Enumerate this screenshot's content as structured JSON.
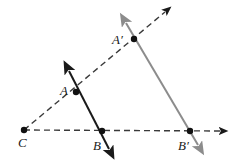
{
  "figure": {
    "background_color": "#ffffff",
    "width": 239,
    "height": 163
  },
  "colors": {
    "ink": "#1a1a1a",
    "dashed": "#3a3a3a",
    "image_gray": "#8c8c8c",
    "point_fill": "#111111"
  },
  "points": [
    {
      "id": "C",
      "label": "C",
      "x": 24,
      "y": 130,
      "label_x": 18,
      "label_y": 147,
      "dot": true
    },
    {
      "id": "A",
      "label": "A",
      "x": 76,
      "y": 92,
      "label_x": 60,
      "label_y": 95,
      "dot": true
    },
    {
      "id": "B",
      "label": "B",
      "x": 102,
      "y": 131,
      "label_x": 93,
      "label_y": 150,
      "dot": true
    },
    {
      "id": "Ap",
      "label": "A′",
      "x": 134,
      "y": 39,
      "label_x": 112,
      "label_y": 44,
      "dot": true
    },
    {
      "id": "Bp",
      "label": "B′",
      "x": 190,
      "y": 131,
      "label_x": 178,
      "label_y": 150,
      "dot": true
    }
  ],
  "lines": [
    {
      "id": "ray-C-A-Ap",
      "name": "dashed-ray-through-A-and-A-prime",
      "style": "dashed",
      "color": "#3a3a3a",
      "from": {
        "x": 24,
        "y": 130
      },
      "to": {
        "x": 165,
        "y": 12
      },
      "arrow_end": true,
      "arrow_start": false
    },
    {
      "id": "ray-C-B-Bp",
      "name": "dashed-ray-through-B-and-B-prime",
      "style": "dashed",
      "color": "#3a3a3a",
      "from": {
        "x": 24,
        "y": 130
      },
      "to": {
        "x": 220,
        "y": 131
      },
      "arrow_end": true,
      "arrow_start": false
    },
    {
      "id": "line-A-B",
      "name": "solid-line-AB-preimage",
      "style": "solid",
      "color": "#1a1a1a",
      "from": {
        "x": 68,
        "y": 70
      },
      "to": {
        "x": 110,
        "y": 150
      },
      "arrow_end": true,
      "arrow_start": true
    },
    {
      "id": "line-Ap-Bp",
      "name": "solid-line-A-prime-B-prime-image",
      "style": "solid",
      "color": "#8c8c8c",
      "from": {
        "x": 125,
        "y": 22
      },
      "to": {
        "x": 199,
        "y": 146
      },
      "arrow_end": true,
      "arrow_start": true
    }
  ],
  "legend": {
    "preimage_label": "AB",
    "image_label": "A′B′",
    "center_label": "C"
  }
}
